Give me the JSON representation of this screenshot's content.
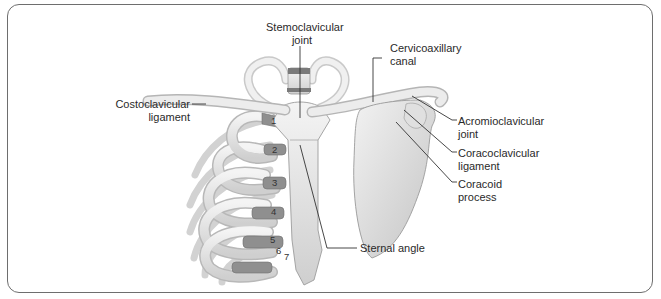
{
  "figure": {
    "labels": {
      "sternoclavicular_joint": [
        "Stemoclavicular",
        "joint"
      ],
      "cervicoaxillary_canal": [
        "Cervicoaxillary",
        "canal"
      ],
      "costoclavicular_ligament": [
        "Costoclavicular",
        "ligament"
      ],
      "acromioclavicular_joint": [
        "Acromioclavicular",
        "joint"
      ],
      "coracoclavicular_ligament": [
        "Coracoclavicular",
        "ligament"
      ],
      "coracoid_process": [
        "Coracoid",
        "process"
      ],
      "sternal_angle": "Sternal angle"
    },
    "rib_numbers": [
      "1",
      "2",
      "3",
      "4",
      "5",
      "6",
      "7"
    ],
    "colors": {
      "frame": "#6e6e6e",
      "bone": "#e6e6e6",
      "bone_shadow": "#b5b5b5",
      "cartilage": "#8a8a8a",
      "leader_line": "#333333"
    }
  }
}
